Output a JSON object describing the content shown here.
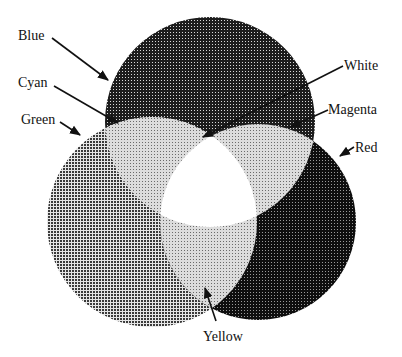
{
  "diagram": {
    "type": "additive-color-venn",
    "circles": [
      {
        "name": "Blue",
        "cx": 210,
        "cy": 122,
        "r": 105,
        "pattern": "dark-grid"
      },
      {
        "name": "Green",
        "cx": 152,
        "cy": 222,
        "r": 105,
        "pattern": "medium-grid"
      },
      {
        "name": "Red",
        "cx": 258,
        "cy": 222,
        "r": 98,
        "pattern": "dark-dots"
      }
    ],
    "regions": {
      "cyan": "light-dots",
      "magenta": "light-dots",
      "yellow": "light-dots",
      "white": "white"
    },
    "labels": {
      "blue": "Blue",
      "cyan": "Cyan",
      "green": "Green",
      "white": "White",
      "magenta": "Magenta",
      "red": "Red",
      "yellow": "Yellow"
    }
  }
}
